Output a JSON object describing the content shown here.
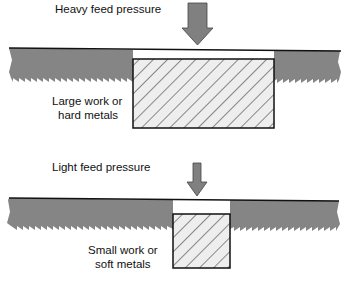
{
  "colors": {
    "blade": "#858585",
    "blade_edge": "#111111",
    "arrow": "#808080",
    "work_fill": "#eeeeee",
    "hatch": "#222222"
  },
  "panels": [
    {
      "id": "heavy",
      "pressure_label": "Heavy feed pressure",
      "work_label_line1": "Large work or",
      "work_label_line2": "hard metals"
    },
    {
      "id": "light",
      "pressure_label": "Light feed pressure",
      "work_label_line1": "Small work or",
      "work_label_line2": "soft metals"
    }
  ]
}
